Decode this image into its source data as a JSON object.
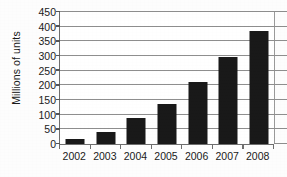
{
  "chart_data": {
    "type": "bar",
    "title": "",
    "subtitle": "",
    "xlabel": "",
    "ylabel": "Millions of units",
    "categories": [
      "2002",
      "2003",
      "2004",
      "2005",
      "2006",
      "2007",
      "2008"
    ],
    "values": [
      18,
      40,
      90,
      137,
      210,
      297,
      385
    ],
    "ylim": [
      0,
      450
    ],
    "ytick_step": 50,
    "yticks": [
      0,
      50,
      100,
      150,
      200,
      250,
      300,
      350,
      400,
      450
    ],
    "ytick_labels": [
      "0",
      "50",
      "100",
      "150",
      "200",
      "250",
      "300",
      "350",
      "400",
      "450"
    ],
    "grid": true,
    "grid_axis": "y",
    "legend": false,
    "legend_position": "none",
    "bar_color": "#191919",
    "grid_color": "#8e8e8e",
    "axis_color": "#6e6e6e",
    "background_color": "#ffffff",
    "text_color": "#1b1b1b",
    "series": [
      {
        "name": "Units",
        "values": [
          18,
          40,
          90,
          137,
          210,
          297,
          385
        ]
      }
    ]
  }
}
